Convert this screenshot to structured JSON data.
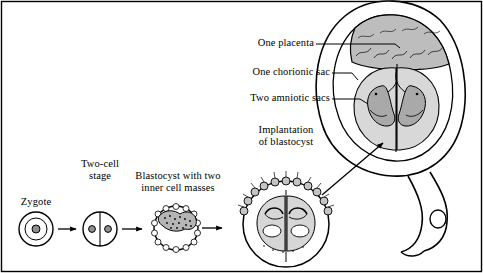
{
  "figure": {
    "background_color": "#ffffff",
    "line_color": "#000000",
    "fill_gray": "#c9c9c9",
    "fill_light": "#e8e8e8"
  },
  "stage_labels": [
    {
      "id": "zygote",
      "text": "Zygote"
    },
    {
      "id": "two-cell-stage",
      "line1": "Two-cell",
      "line2": "stage"
    },
    {
      "id": "blastocyst",
      "line1": "Blastocyst with two",
      "line2": "inner cell masses"
    },
    {
      "id": "implantation",
      "line1": "Implantation",
      "line2": "of blastocyst"
    }
  ],
  "callouts": [
    {
      "id": "one-placenta",
      "text": "One placenta"
    },
    {
      "id": "one-chorionic-sac",
      "text": "One chorionic sac"
    },
    {
      "id": "two-amniotic-sacs",
      "text": "Two amniotic sacs"
    }
  ]
}
